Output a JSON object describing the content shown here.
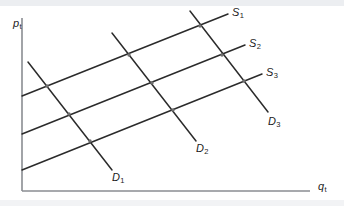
{
  "figure": {
    "background_color": "#ffffff",
    "band_color": "#eceef1",
    "line_color": "#2b2b2b",
    "axis_color": "#8a8d92"
  },
  "axes": {
    "y_label_base": "p",
    "y_label_sub": "t",
    "x_label_base": "q",
    "x_label_sub": "t"
  },
  "curve_labels": {
    "supply": [
      {
        "base": "S",
        "sub": "1"
      },
      {
        "base": "S",
        "sub": "2"
      },
      {
        "base": "S",
        "sub": "3"
      }
    ],
    "demand": [
      {
        "base": "D",
        "sub": "1"
      },
      {
        "base": "D",
        "sub": "2"
      },
      {
        "base": "D",
        "sub": "3"
      }
    ]
  },
  "chart_data": {
    "type": "line",
    "xlabel": "q_t",
    "ylabel": "p_t",
    "grid": false,
    "legend": "inline-end-labels",
    "xlim": [
      0,
      344
    ],
    "ylim": [
      206,
      0
    ],
    "axis_lines": {
      "y_axis": {
        "x1": 22,
        "y1": 18,
        "x2": 22,
        "y2": 191
      },
      "x_axis": {
        "x1": 22,
        "y1": 191,
        "x2": 310,
        "y2": 191
      }
    },
    "series": [
      {
        "name": "S1",
        "kind": "supply",
        "slope_sign": "positive",
        "points": [
          {
            "x": 22,
            "y": 96
          },
          {
            "x": 228,
            "y": 14
          }
        ],
        "label_position": {
          "x": 232,
          "y": 7
        }
      },
      {
        "name": "S2",
        "kind": "supply",
        "slope_sign": "positive",
        "points": [
          {
            "x": 22,
            "y": 134
          },
          {
            "x": 245,
            "y": 45
          }
        ],
        "label_position": {
          "x": 249,
          "y": 38
        }
      },
      {
        "name": "S3",
        "kind": "supply",
        "slope_sign": "positive",
        "points": [
          {
            "x": 22,
            "y": 170
          },
          {
            "x": 262,
            "y": 74
          }
        ],
        "label_position": {
          "x": 266,
          "y": 67
        }
      },
      {
        "name": "D1",
        "kind": "demand",
        "slope_sign": "negative",
        "points": [
          {
            "x": 28,
            "y": 62
          },
          {
            "x": 112,
            "y": 170
          }
        ],
        "label_position": {
          "x": 112,
          "y": 172
        }
      },
      {
        "name": "D2",
        "kind": "demand",
        "slope_sign": "negative",
        "points": [
          {
            "x": 112,
            "y": 33
          },
          {
            "x": 196,
            "y": 141
          }
        ],
        "label_position": {
          "x": 196,
          "y": 143
        }
      },
      {
        "name": "D3",
        "kind": "demand",
        "slope_sign": "negative",
        "points": [
          {
            "x": 190,
            "y": 11
          },
          {
            "x": 268,
            "y": 112
          }
        ],
        "label_position": {
          "x": 268,
          "y": 116
        }
      }
    ],
    "intersections": [
      {
        "x": 47,
        "y": 86,
        "curves": [
          "S1",
          "D1"
        ]
      },
      {
        "x": 69,
        "y": 114,
        "curves": [
          "S2",
          "D1"
        ]
      },
      {
        "x": 90,
        "y": 141,
        "curves": [
          "S3",
          "D1"
        ]
      },
      {
        "x": 129,
        "y": 55,
        "curves": [
          "S1",
          "D2"
        ]
      },
      {
        "x": 152,
        "y": 83,
        "curves": [
          "S2",
          "D2"
        ]
      },
      {
        "x": 173,
        "y": 110,
        "curves": [
          "S3",
          "D2"
        ]
      },
      {
        "x": 200,
        "y": 26,
        "curves": [
          "S1",
          "D3"
        ]
      },
      {
        "x": 222,
        "y": 55,
        "curves": [
          "S2",
          "D3"
        ]
      },
      {
        "x": 244,
        "y": 81,
        "curves": [
          "S3",
          "D3"
        ]
      }
    ]
  }
}
